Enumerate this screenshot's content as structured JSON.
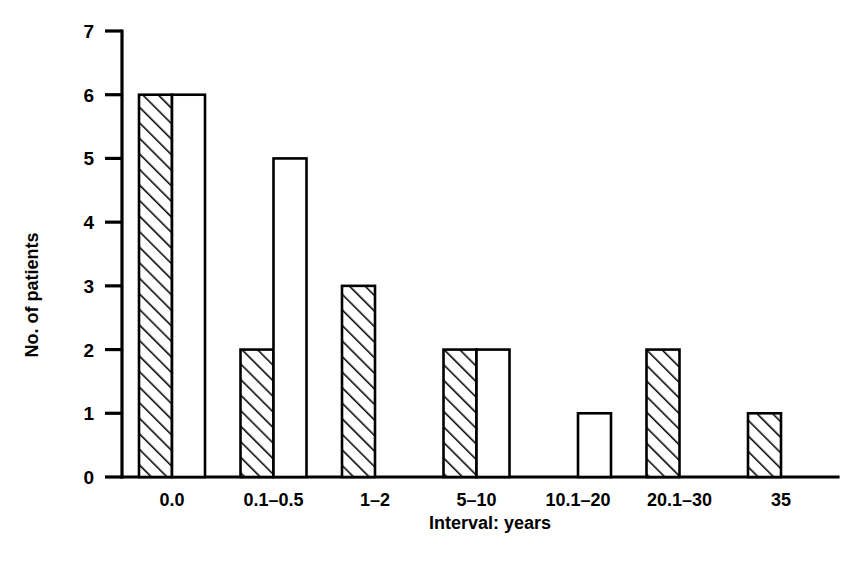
{
  "chart_data": {
    "type": "bar",
    "title": "",
    "subtitle": "",
    "xlabel": "Interval: years",
    "ylabel": "No. of patients",
    "categories": [
      "0.0",
      "0.1–0.5",
      "1–2",
      "5–10",
      "10.1–20",
      "20.1–30",
      "35"
    ],
    "series": [
      {
        "name": "hatched",
        "style": "hatched",
        "values": [
          6,
          2,
          3,
          2,
          0,
          2,
          1
        ]
      },
      {
        "name": "open",
        "style": "open",
        "values": [
          6,
          5,
          0,
          2,
          1,
          0,
          0
        ]
      }
    ],
    "ylim": [
      0,
      7
    ],
    "ytick_labels": [
      "0",
      "1",
      "2",
      "3",
      "4",
      "5",
      "6",
      "7"
    ],
    "ytick_values": [
      0,
      1,
      2,
      3,
      4,
      5,
      6,
      7
    ],
    "grid": false,
    "legend": "none",
    "colors": {
      "axis": "#000000",
      "bar_stroke": "#000000",
      "bar_fill": "#ffffff",
      "background": "#ffffff"
    }
  },
  "axes": {
    "y_title": "No. of patients",
    "x_title": "Interval: years"
  }
}
